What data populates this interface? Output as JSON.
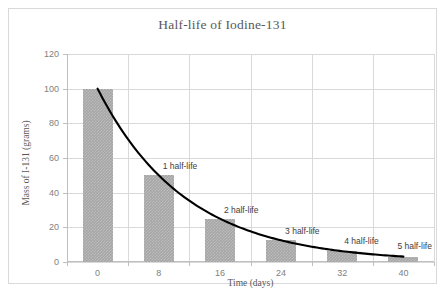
{
  "chart_data": {
    "type": "bar",
    "title": "Half-life of Iodine-131",
    "xlabel": "Time (days)",
    "ylabel": "Mass of I-131 (grams)",
    "categories": [
      "0",
      "8",
      "16",
      "24",
      "32",
      "40"
    ],
    "x": [
      0,
      8,
      16,
      24,
      32,
      40
    ],
    "values": [
      100,
      50,
      25,
      12.5,
      6.25,
      3.125
    ],
    "series": [
      {
        "name": "Mass of I-131",
        "type": "bar",
        "values": [
          100,
          50,
          25,
          12.5,
          6.25,
          3.125
        ]
      },
      {
        "name": "Decay curve",
        "type": "line",
        "values": [
          100,
          50,
          25,
          12.5,
          6.25,
          3.125
        ]
      }
    ],
    "xlim": [
      -4,
      44
    ],
    "ylim": [
      0,
      120
    ],
    "ytick_labels": [
      "0",
      "20",
      "40",
      "60",
      "80",
      "100",
      "120"
    ],
    "yticks": [
      0,
      20,
      40,
      60,
      80,
      100,
      120
    ],
    "xtick_labels": [
      "0",
      "8",
      "16",
      "24",
      "32",
      "40"
    ],
    "grid": true,
    "legend": false,
    "bar_color": "#a6a6a6",
    "line_color": "#000000",
    "grid_color": "#d9d9d9",
    "text_color": "#595959",
    "annotations": [
      {
        "label": "1 half-life",
        "x": 8,
        "y": 50
      },
      {
        "label": "2 half-life",
        "x": 16,
        "y": 25
      },
      {
        "label": "3 half-life",
        "x": 24,
        "y": 12.5
      },
      {
        "label": "4 half-life",
        "x": 32,
        "y": 6.25
      },
      {
        "label": "5 half-life",
        "x": 40,
        "y": 3.125
      }
    ]
  }
}
